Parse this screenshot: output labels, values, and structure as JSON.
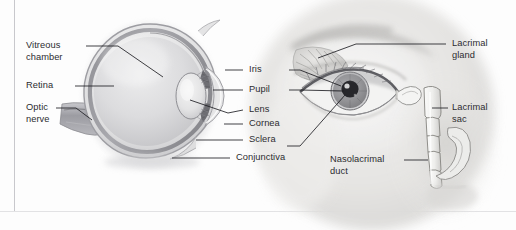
{
  "figure": {
    "background_color": "#fdfdfd",
    "text_color": "#2c2c30",
    "rule_color": "#c8c8cc"
  },
  "labels": {
    "vitreous_chamber": "Vitreous\nchamber",
    "retina": "Retina",
    "optic_nerve": "Optic\nnerve",
    "iris": "Iris",
    "pupil": "Pupil",
    "lens": "Lens",
    "cornea": "Cornea",
    "sclera": "Sclera",
    "conjunctiva": "Conjunctiva",
    "lacrimal_gland": "Lacrimal\ngland",
    "lacrimal_sac": "Lacrimal\nsac",
    "nasolacrimal_duct": "Nasolacrimal\nduct"
  },
  "illustrations": {
    "eyeball_cross_section": "grayscale sagittal section of the eyeball showing sclera, retina, vitreous chamber, lens, pupil, iris, cornea, conjunctiva and optic nerve",
    "eye_photograph": "grayscale photograph of a human eye with eyelid, lashes, iris and pupil",
    "lacrimal_apparatus": "line drawing of lacrimal gland, lacrimal sac and nasolacrimal duct overlaid on the photograph"
  }
}
